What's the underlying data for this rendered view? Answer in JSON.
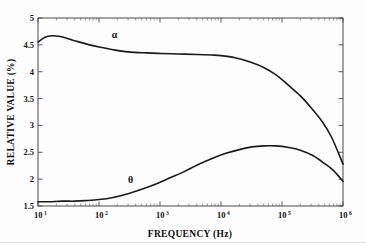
{
  "chart_data": {
    "type": "line",
    "title": "",
    "subtitle": "",
    "xlabel": "FREQUENCY (Hz)",
    "ylabel": "RELATIVE VALUE (%)",
    "xscale": "log",
    "yscale": "linear",
    "xlim": [
      10,
      1000000
    ],
    "ylim": [
      1.5,
      5
    ],
    "grid": false,
    "legend_position": "inline-annotation",
    "xticks": [
      {
        "value": 10,
        "label": "10",
        "exponent": "1"
      },
      {
        "value": 100,
        "label": "10",
        "exponent": "2"
      },
      {
        "value": 1000,
        "label": "10",
        "exponent": "3"
      },
      {
        "value": 10000,
        "label": "10",
        "exponent": "4"
      },
      {
        "value": 100000,
        "label": "10",
        "exponent": "5"
      },
      {
        "value": 1000000,
        "label": "10",
        "exponent": "6"
      }
    ],
    "yticks": [
      {
        "value": 1.5,
        "label": "1.5"
      },
      {
        "value": 2,
        "label": "2"
      },
      {
        "value": 2.5,
        "label": "2.5"
      },
      {
        "value": 3,
        "label": "3"
      },
      {
        "value": 3.5,
        "label": "3.5"
      },
      {
        "value": 4,
        "label": "4"
      },
      {
        "value": 4.5,
        "label": "4.5"
      },
      {
        "value": 5,
        "label": "5"
      }
    ],
    "series": [
      {
        "name": "alpha",
        "annotation": "α",
        "annotation_x": 180,
        "annotation_y": 4.62,
        "color": "#1a1a1a",
        "x": [
          10,
          13,
          17,
          22,
          30,
          45,
          70,
          100,
          170,
          300,
          600,
          1000,
          2000,
          4000,
          7000,
          10000,
          17000,
          30000,
          50000,
          80000,
          130000,
          200000,
          300000,
          450000,
          650000,
          1000000
        ],
        "y": [
          4.55,
          4.64,
          4.67,
          4.66,
          4.62,
          4.56,
          4.5,
          4.46,
          4.41,
          4.37,
          4.35,
          4.34,
          4.33,
          4.32,
          4.31,
          4.3,
          4.26,
          4.18,
          4.08,
          3.94,
          3.74,
          3.55,
          3.33,
          3.08,
          2.78,
          2.28
        ]
      },
      {
        "name": "theta",
        "annotation": "θ",
        "annotation_x": 330,
        "annotation_y": 1.92,
        "color": "#1a1a1a",
        "x": [
          10,
          15,
          25,
          40,
          60,
          100,
          170,
          300,
          500,
          900,
          1500,
          2500,
          4000,
          7000,
          12000,
          20000,
          32000,
          50000,
          80000,
          130000,
          200000,
          320000,
          500000,
          700000,
          1000000
        ],
        "y": [
          1.58,
          1.58,
          1.59,
          1.59,
          1.6,
          1.62,
          1.66,
          1.73,
          1.81,
          1.92,
          2.03,
          2.14,
          2.26,
          2.38,
          2.48,
          2.55,
          2.6,
          2.62,
          2.62,
          2.59,
          2.54,
          2.44,
          2.29,
          2.16,
          1.96
        ]
      }
    ]
  },
  "axes": {
    "x_title": "FREQUENCY (Hz)",
    "y_title": "RELATIVE VALUE (%)"
  },
  "annotations": {
    "alpha_label": "α",
    "theta_label": "θ"
  },
  "colors": {
    "curve": "#1a1a1a",
    "axis": "#4a4a4a",
    "text": "#111111",
    "background": "#fdfdfd"
  }
}
